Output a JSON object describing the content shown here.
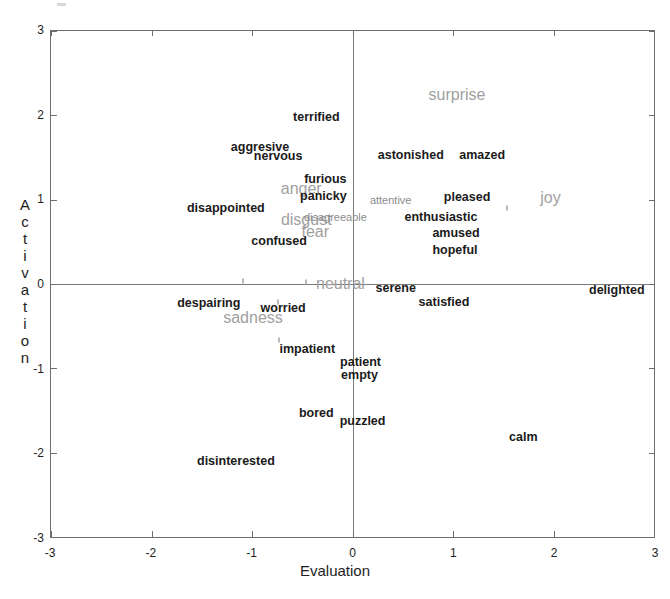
{
  "chart_data": {
    "type": "scatter",
    "title": "",
    "xlabel": "Evaluation",
    "ylabel": "Activation",
    "ylabel_letters": [
      "A",
      "c",
      "t",
      "i",
      "v",
      "a",
      "t",
      "i",
      "o",
      "n"
    ],
    "xlim": [
      -3,
      3
    ],
    "ylim": [
      -3,
      3
    ],
    "xticks": [
      -3,
      -2,
      -1,
      0,
      1,
      2,
      3
    ],
    "xticklabels": [
      "-3",
      "-2",
      "-1",
      "0",
      "1",
      "2",
      "3"
    ],
    "yticks": [
      -3,
      -2,
      -1,
      0,
      1,
      2,
      3
    ],
    "yticklabels": [
      "-3",
      "-2",
      "-1",
      "0",
      "1",
      "2",
      "3"
    ],
    "grid": false,
    "legend": "none",
    "axes_through_origin": true,
    "colors": {
      "word_label": "#1a1a1a",
      "category_label": "#a0a0a0",
      "faint_label": "#8b8b8b",
      "axis": "#6e6e6e",
      "background": "#ffffff"
    },
    "points": [
      {
        "label": "surprise",
        "x": 1.04,
        "y": 2.24,
        "style": "category"
      },
      {
        "label": "terrified",
        "x": -0.36,
        "y": 1.98,
        "style": "word"
      },
      {
        "label": "aggresive",
        "x": -0.92,
        "y": 1.63,
        "style": "word"
      },
      {
        "label": "nervous",
        "x": -0.74,
        "y": 1.52,
        "style": "word"
      },
      {
        "label": "astonished",
        "x": 0.58,
        "y": 1.53,
        "style": "word"
      },
      {
        "label": "amazed",
        "x": 1.29,
        "y": 1.53,
        "style": "word"
      },
      {
        "label": "furious",
        "x": -0.27,
        "y": 1.25,
        "style": "word"
      },
      {
        "label": "anger",
        "x": -0.51,
        "y": 1.13,
        "style": "category"
      },
      {
        "label": "panicky",
        "x": -0.29,
        "y": 1.04,
        "style": "word"
      },
      {
        "label": "attentive",
        "x": 0.38,
        "y": 1.0,
        "style": "faint"
      },
      {
        "label": "pleased",
        "x": 1.14,
        "y": 1.03,
        "style": "word"
      },
      {
        "label": "joy",
        "x": 1.97,
        "y": 1.02,
        "style": "category"
      },
      {
        "label": "disappointed",
        "x": -1.26,
        "y": 0.9,
        "style": "word"
      },
      {
        "label": "disgust",
        "x": -0.46,
        "y": 0.76,
        "style": "category"
      },
      {
        "label": "disagreeable",
        "x": -0.17,
        "y": 0.79,
        "style": "faint"
      },
      {
        "label": "enthusiastic",
        "x": 0.88,
        "y": 0.79,
        "style": "word"
      },
      {
        "label": "fear",
        "x": -0.37,
        "y": 0.62,
        "style": "category"
      },
      {
        "label": "amused",
        "x": 1.03,
        "y": 0.61,
        "style": "word"
      },
      {
        "label": "confused",
        "x": -0.73,
        "y": 0.51,
        "style": "word"
      },
      {
        "label": "hopeful",
        "x": 1.02,
        "y": 0.4,
        "style": "word"
      },
      {
        "label": "neutral",
        "x": -0.12,
        "y": 0.0,
        "style": "category"
      },
      {
        "label": "serene",
        "x": 0.43,
        "y": -0.05,
        "style": "word"
      },
      {
        "label": "delighted",
        "x": 2.63,
        "y": -0.07,
        "style": "word"
      },
      {
        "label": "despairing",
        "x": -1.43,
        "y": -0.22,
        "style": "word"
      },
      {
        "label": "satisfied",
        "x": 0.91,
        "y": -0.21,
        "style": "word"
      },
      {
        "label": "worried",
        "x": -0.69,
        "y": -0.29,
        "style": "word"
      },
      {
        "label": "sadness",
        "x": -0.99,
        "y": -0.4,
        "style": "category"
      },
      {
        "label": "impatient",
        "x": -0.45,
        "y": -0.77,
        "style": "word"
      },
      {
        "label": "patient",
        "x": 0.08,
        "y": -0.93,
        "style": "word"
      },
      {
        "label": "empty",
        "x": 0.07,
        "y": -1.08,
        "style": "word"
      },
      {
        "label": "bored",
        "x": -0.36,
        "y": -1.53,
        "style": "word"
      },
      {
        "label": "puzzled",
        "x": 0.1,
        "y": -1.63,
        "style": "word"
      },
      {
        "label": "calm",
        "x": 1.7,
        "y": -1.82,
        "style": "word"
      },
      {
        "label": "disinterested",
        "x": -1.16,
        "y": -2.1,
        "style": "word"
      }
    ],
    "faint_marks": [
      {
        "x": -0.46,
        "y": 0.02
      },
      {
        "x": -0.74,
        "y": -0.21
      },
      {
        "x": -0.73,
        "y": -0.66
      },
      {
        "x": 1.54,
        "y": 0.9
      },
      {
        "x": -1.09,
        "y": 0.04
      }
    ]
  }
}
